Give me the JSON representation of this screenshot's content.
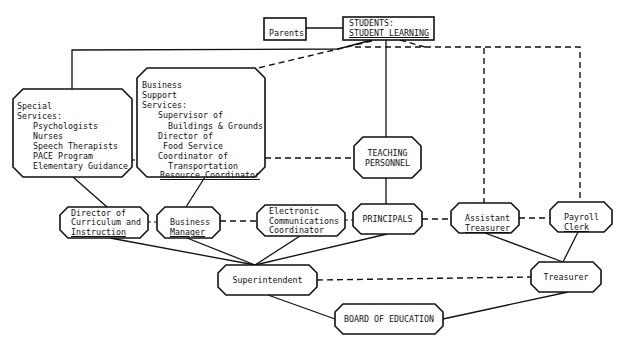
{
  "diagram": {
    "type": "organizational-chart",
    "nodes": {
      "parents": {
        "label": "Parents"
      },
      "students": {
        "lines": [
          "STUDENTS:",
          "STUDENT LEARNING"
        ]
      },
      "special_services": {
        "lines": [
          "Special",
          "Services:",
          "Psychologists",
          "Nurses",
          "Speech Therapists",
          "PACE Program",
          "Elementary Guidance"
        ]
      },
      "business_support": {
        "lines": [
          "Business",
          "Support",
          "Services:",
          "Supervisor of",
          "Buildings & Grounds",
          "Director of",
          "Food Service",
          "Coordinator of",
          "Transportation",
          "Resource Coordinator"
        ]
      },
      "teaching_personnel": {
        "lines": [
          "TEACHING",
          "PERSONNEL"
        ]
      },
      "director_curriculum": {
        "lines": [
          "Director of",
          "Curriculum and",
          "Instruction"
        ]
      },
      "business_manager": {
        "lines": [
          "Business",
          "Manager"
        ]
      },
      "electronic_comm": {
        "lines": [
          "Electronic",
          "Communications",
          "Coordinator"
        ]
      },
      "principals": {
        "label": "PRINCIPALS"
      },
      "assistant_treasurer": {
        "lines": [
          "Assistant",
          "Treasurer"
        ]
      },
      "payroll_clerk": {
        "lines": [
          "Payroll",
          "Clerk"
        ]
      },
      "superintendent": {
        "label": "Superintendent"
      },
      "treasurer": {
        "label": "Treasurer"
      },
      "board": {
        "label": "BOARD OF EDUCATION"
      }
    },
    "edges": [
      {
        "from": "parents",
        "to": "students",
        "style": "solid"
      },
      {
        "from": "students",
        "to": "special_services",
        "style": "solid"
      },
      {
        "from": "students",
        "to": "business_support",
        "style": "dashed"
      },
      {
        "from": "students",
        "to": "teaching_personnel",
        "style": "solid"
      },
      {
        "from": "students",
        "to": "assistant_treasurer",
        "style": "dashed"
      },
      {
        "from": "students",
        "to": "payroll_clerk",
        "style": "dashed"
      },
      {
        "from": "special_services",
        "to": "business_support",
        "style": "dashed"
      },
      {
        "from": "business_support",
        "to": "teaching_personnel",
        "style": "dashed"
      },
      {
        "from": "special_services",
        "to": "director_curriculum",
        "style": "solid"
      },
      {
        "from": "business_support",
        "to": "business_manager",
        "style": "solid"
      },
      {
        "from": "teaching_personnel",
        "to": "principals",
        "style": "solid"
      },
      {
        "from": "director_curriculum",
        "to": "business_manager",
        "style": "dashed"
      },
      {
        "from": "business_manager",
        "to": "electronic_comm",
        "style": "dashed"
      },
      {
        "from": "electronic_comm",
        "to": "principals",
        "style": "dashed"
      },
      {
        "from": "principals",
        "to": "assistant_treasurer",
        "style": "dashed"
      },
      {
        "from": "assistant_treasurer",
        "to": "payroll_clerk",
        "style": "dashed"
      },
      {
        "from": "director_curriculum",
        "to": "superintendent",
        "style": "solid"
      },
      {
        "from": "business_manager",
        "to": "superintendent",
        "style": "solid"
      },
      {
        "from": "electronic_comm",
        "to": "superintendent",
        "style": "solid"
      },
      {
        "from": "principals",
        "to": "superintendent",
        "style": "solid"
      },
      {
        "from": "assistant_treasurer",
        "to": "treasurer",
        "style": "solid"
      },
      {
        "from": "payroll_clerk",
        "to": "treasurer",
        "style": "solid"
      },
      {
        "from": "superintendent",
        "to": "treasurer",
        "style": "dashed"
      },
      {
        "from": "superintendent",
        "to": "board",
        "style": "solid"
      },
      {
        "from": "treasurer",
        "to": "board",
        "style": "solid"
      }
    ]
  }
}
